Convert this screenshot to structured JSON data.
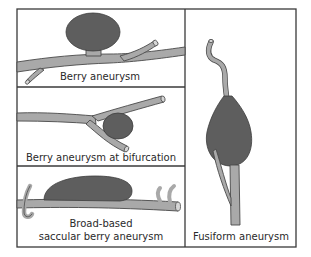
{
  "figure": {
    "panels": [
      {
        "id": "berry",
        "label": "Berry aneurysm"
      },
      {
        "id": "bifurcation",
        "label": "Berry aneurysm at bifurcation"
      },
      {
        "id": "broad-based",
        "label_line1": "Broad-based",
        "label_line2": "saccular berry aneurysm"
      },
      {
        "id": "fusiform",
        "label": "Fusiform aneurysm"
      }
    ],
    "colors": {
      "vessel": "#a9a9a9",
      "aneurysm_sac": "#5e5e5e",
      "outline": "#3a3a3a",
      "background": "#ffffff"
    }
  }
}
